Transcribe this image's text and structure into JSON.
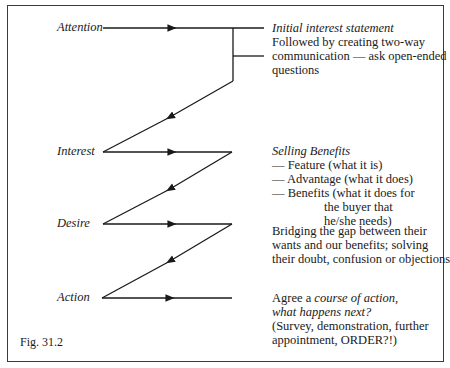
{
  "diagram": {
    "type": "AIDA sales process flow",
    "stages": [
      {
        "label": "Attention"
      },
      {
        "label": "Interest"
      },
      {
        "label": "Desire"
      },
      {
        "label": "Action"
      }
    ],
    "notes": {
      "attention": {
        "heading": "Initial interest statement",
        "line1": "Followed by creating two-way",
        "line2": "communication — ask open-ended",
        "line3": "questions"
      },
      "interest": {
        "heading": "Selling Benefits",
        "item1": "— Feature (what it is)",
        "item2": "— Advantage (what it does)",
        "item3": "— Benefits (what it does for",
        "item3_cont1": "the buyer that",
        "item3_cont2": "he/she needs)"
      },
      "desire": {
        "line1": "Bridging the gap between their",
        "line2": "wants and our benefits; solving",
        "line3": "their doubt, confusion or objections"
      },
      "action": {
        "prefix": "Agree a ",
        "italic1": "course of action,",
        "italic2": "what happens next?",
        "line3": "(Survey, demonstration, further",
        "line4": "appointment,  ORDER?!)"
      }
    },
    "caption": "Fig. 31.2",
    "colors": {
      "ink": "#1a1a1a",
      "frame": "#3a3a3a",
      "background": "#ffffff"
    }
  }
}
